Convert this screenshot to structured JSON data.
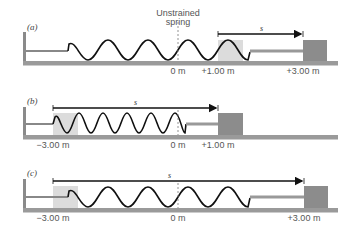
{
  "title": {
    "line1": "Unstrained",
    "line2": "spring"
  },
  "colors": {
    "floor": "#8a8a8a",
    "block": "#8c8c8c",
    "shade": "#dcdcdc",
    "spring_dark": "#111111",
    "spring_light": "#bbbbbb",
    "arrow": "#111111"
  },
  "panels": [
    {
      "label": "(a)",
      "displacement_symbol": "s",
      "positions": [
        {
          "text": "0 m"
        },
        {
          "text": "+1.00 m"
        },
        {
          "text": "+3.00 m"
        }
      ]
    },
    {
      "label": "(b)",
      "displacement_symbol": "s",
      "positions": [
        {
          "text": "−3.00 m"
        },
        {
          "text": "0 m"
        },
        {
          "text": "+1.00 m"
        }
      ]
    },
    {
      "label": "(c)",
      "displacement_symbol": "s",
      "positions": [
        {
          "text": "−3.00 m"
        },
        {
          "text": "0 m"
        },
        {
          "text": "+3.00 m"
        }
      ]
    }
  ]
}
